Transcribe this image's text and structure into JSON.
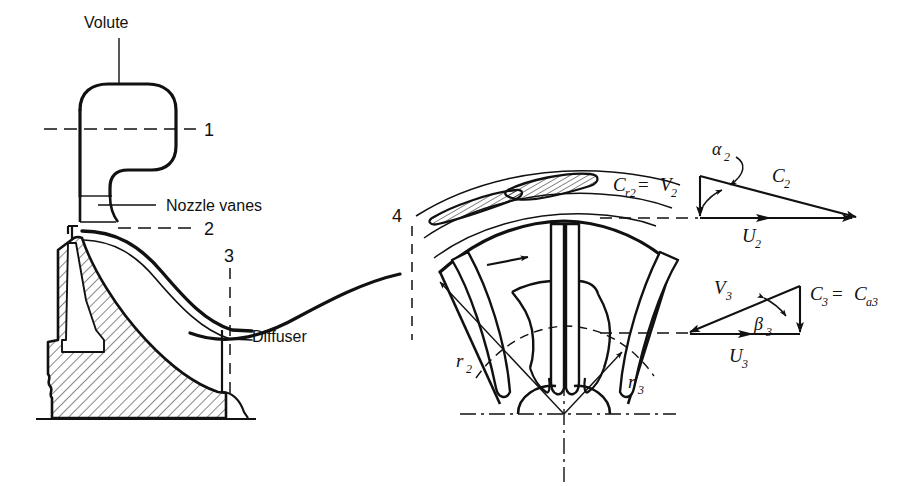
{
  "figure": {
    "background": "#ffffff",
    "ink_color": "#111111"
  },
  "left_section": {
    "labels": {
      "volute": "Volute",
      "nozzle_vanes": "Nozzle vanes",
      "station_1": "1",
      "station_2": "2",
      "station_3": "3",
      "diffuser": "Diffuser"
    }
  },
  "rotor_view": {
    "labels": {
      "station_4": "4",
      "radius_2": "r",
      "radius_2_sub": "2",
      "radius_3": "r",
      "radius_3_sub": "3"
    }
  },
  "triangle_2": {
    "name": "rotor-inlet-velocity-triangle",
    "radial_label": "C",
    "radial_sub": "r2",
    "equals": " = ",
    "relative_label": "V",
    "relative_sub": "2",
    "absolute_label": "C",
    "absolute_sub": "2",
    "blade_speed_label": "U",
    "blade_speed_sub": "2",
    "angle_label": "α",
    "angle_sub": "2"
  },
  "triangle_3": {
    "name": "rotor-exit-velocity-triangle",
    "relative_label": "V",
    "relative_sub": "3",
    "absolute_label": "C",
    "absolute_sub": "3",
    "axial_label": "C",
    "axial_sub": "a3",
    "equals": " = ",
    "blade_speed_label": "U",
    "blade_speed_sub": "3",
    "angle_label": "β",
    "angle_sub": "3"
  }
}
